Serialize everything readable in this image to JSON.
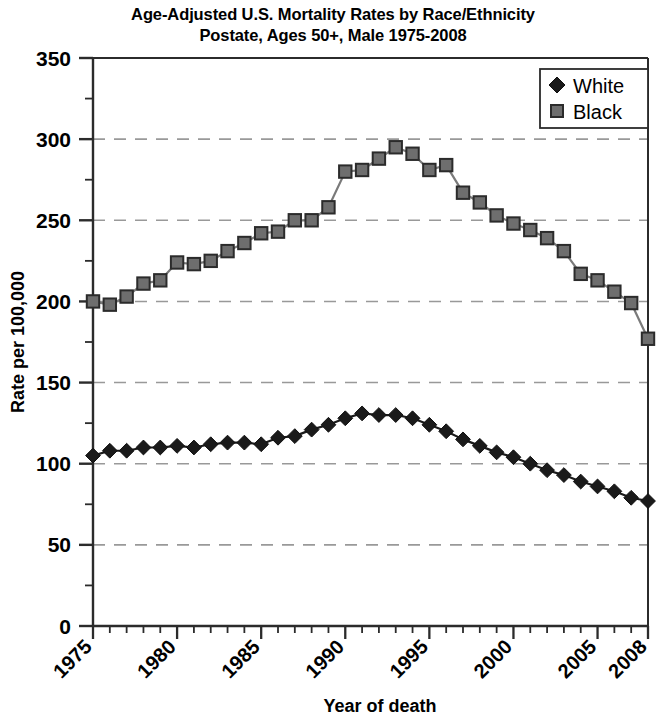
{
  "chart_data": {
    "type": "line",
    "title": "Age-Adjusted U.S. Mortality Rates by Race/Ethnicity\nPostate, Ages 50+, Male 1975-2008",
    "title_line1": "Age-Adjusted U.S. Mortality Rates by Race/Ethnicity",
    "title_line2": "Postate, Ages 50+, Male 1975-2008",
    "xlabel": "Year of death",
    "ylabel": "Rate per 100,000",
    "xlim": [
      1975,
      2008
    ],
    "ylim": [
      0,
      350
    ],
    "ytick_values": [
      0,
      50,
      100,
      150,
      200,
      250,
      300,
      350
    ],
    "ytick_labels": [
      "0",
      "50",
      "100",
      "150",
      "200",
      "250",
      "300",
      "350"
    ],
    "y_minor_tick_step": 25,
    "grid": "horizontal-dashed",
    "grid_color": "#999999",
    "legend_position": "top-right",
    "legend_entries": [
      {
        "name": "White",
        "marker": "diamond",
        "color": "#1a1a1a"
      },
      {
        "name": "Black",
        "marker": "square",
        "color": "#6e6e6e"
      }
    ],
    "x": [
      1975,
      1976,
      1977,
      1978,
      1979,
      1980,
      1981,
      1982,
      1983,
      1984,
      1985,
      1986,
      1987,
      1988,
      1989,
      1990,
      1991,
      1992,
      1993,
      1994,
      1995,
      1996,
      1997,
      1998,
      1999,
      2000,
      2001,
      2002,
      2003,
      2004,
      2005,
      2006,
      2007,
      2008
    ],
    "xtick_labels": [
      "1975",
      "1980",
      "1985",
      "1990",
      "1995",
      "2000",
      "2005",
      "2008"
    ],
    "xtick_label_values": [
      1975,
      1980,
      1985,
      1990,
      1995,
      2000,
      2005,
      2008
    ],
    "series": [
      {
        "name": "White",
        "marker": "diamond",
        "color": "#1a1a1a",
        "line_color": "#1a1a1a",
        "values": [
          105,
          108,
          108,
          110,
          110,
          111,
          110,
          112,
          113,
          113,
          112,
          116,
          117,
          121,
          124,
          128,
          131,
          130,
          130,
          128,
          124,
          120,
          115,
          111,
          107,
          104,
          100,
          96,
          93,
          89,
          86,
          83,
          79,
          77
        ]
      },
      {
        "name": "Black",
        "marker": "square",
        "color": "#6e6e6e",
        "line_color": "#7a7a7a",
        "values": [
          200,
          198,
          203,
          211,
          213,
          224,
          223,
          225,
          231,
          236,
          242,
          243,
          250,
          250,
          258,
          280,
          281,
          288,
          295,
          291,
          281,
          284,
          267,
          261,
          253,
          248,
          244,
          239,
          231,
          217,
          213,
          206,
          199,
          177
        ]
      }
    ]
  }
}
